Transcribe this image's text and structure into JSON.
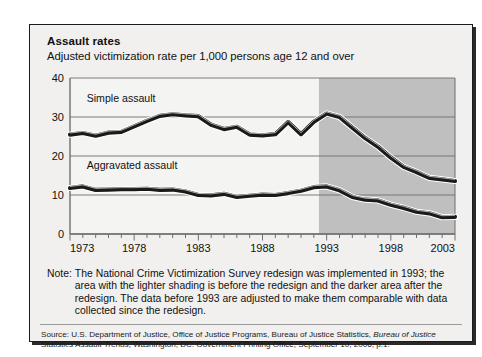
{
  "header": {
    "title": "Assault rates",
    "subtitle": "Adjusted victimization rate per 1,000 persons age 12 and over"
  },
  "note": {
    "label": "Note:",
    "text": "The National Crime Victimization Survey redesign was implemented in 1993; the area with the lighter shading is before the redesign and the darker area after the redesign. The data before 1993 are adjusted to make them comparable with data collected since the redesign."
  },
  "source": {
    "prefix": "Source: U.S. Department of Justice, Office of Justice Programs, Bureau of Justice Statistics, ",
    "italic": "Bureau of Justice Statistics Assault Trends",
    "suffix": ", Washington, DC: Government Printing Office, September 10, 2006, p.1."
  },
  "colors": {
    "panel_background": "#f1f0ee",
    "plot_light_shading": "#f4f4f2",
    "plot_dark_shading": "#bfbfbf",
    "line_color": "#1a1a1a",
    "line_highlight": "#ffffff",
    "axis_color": "#6e6e6e",
    "grid_color": "#6e6e6e",
    "frame_border": "#1c1c1c",
    "text_color": "#111111"
  },
  "chart_data": {
    "type": "line",
    "title": "Assault rates",
    "subtitle": "Adjusted victimization rate per 1,000 persons age 12 and over",
    "xlabel": "",
    "ylabel": "",
    "xlim": [
      1973,
      2003
    ],
    "ylim": [
      0,
      40
    ],
    "yticks": [
      0,
      10,
      20,
      30,
      40
    ],
    "ytick_labels": [
      "0",
      "10",
      "20",
      "30",
      "40"
    ],
    "xticks": [
      1973,
      1974,
      1975,
      1976,
      1977,
      1978,
      1979,
      1980,
      1981,
      1982,
      1983,
      1984,
      1985,
      1986,
      1987,
      1988,
      1989,
      1990,
      1991,
      1992,
      1993,
      1994,
      1995,
      1996,
      1997,
      1998,
      1999,
      2000,
      2001,
      2002,
      2003
    ],
    "xtick_labels_shown": [
      "1973",
      "1978",
      "1983",
      "1988",
      "1993",
      "1998",
      "2003"
    ],
    "grid": "horizontal",
    "legend_position": "inline-labels",
    "redesign_year": 1993,
    "shading_split_x": 1992.4,
    "annotations": [
      {
        "text": "Simple assault",
        "x": 1974.3,
        "y": 33.8
      },
      {
        "text": "Aggravated assault",
        "x": 1974.3,
        "y": 16.6
      }
    ],
    "x": [
      1973,
      1974,
      1975,
      1976,
      1977,
      1978,
      1979,
      1980,
      1981,
      1982,
      1983,
      1984,
      1985,
      1986,
      1987,
      1988,
      1989,
      1990,
      1991,
      1992,
      1993,
      1994,
      1995,
      1996,
      1997,
      1998,
      1999,
      2000,
      2001,
      2002,
      2003
    ],
    "series": [
      {
        "name": "Simple assault",
        "values": [
          25.5,
          25.9,
          25.2,
          26.0,
          26.2,
          27.6,
          29.0,
          30.3,
          30.7,
          30.4,
          30.2,
          28.0,
          26.9,
          27.5,
          25.5,
          25.3,
          25.6,
          28.7,
          25.6,
          28.8,
          30.9,
          30.0,
          27.3,
          24.6,
          22.4,
          19.6,
          17.2,
          15.9,
          14.4,
          14.0,
          13.6
        ]
      },
      {
        "name": "Aggravated assault",
        "values": [
          11.8,
          12.2,
          11.3,
          11.4,
          11.5,
          11.5,
          11.6,
          11.3,
          11.4,
          10.9,
          10.0,
          9.9,
          10.3,
          9.5,
          9.8,
          10.1,
          10.0,
          10.5,
          11.1,
          12.0,
          12.2,
          11.2,
          9.5,
          8.8,
          8.6,
          7.5,
          6.7,
          5.7,
          5.3,
          4.3,
          4.4
        ]
      }
    ]
  }
}
